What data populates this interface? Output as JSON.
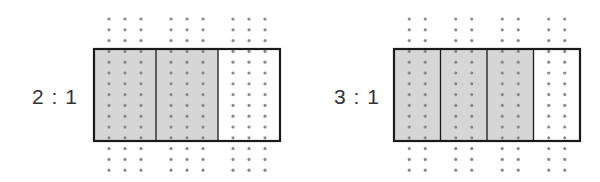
{
  "figures": [
    {
      "ratio_label": "2 : 1",
      "parts": 3,
      "shaded_parts": 2,
      "dots_per_part": 3
    },
    {
      "ratio_label": "3 : 1",
      "parts": 4,
      "shaded_parts": 3,
      "dots_per_part": 2
    }
  ],
  "colors": {
    "shade": "#d6d6d6",
    "dot": "#8a8a8a",
    "border": "#1a1a1a",
    "text": "#333333"
  }
}
